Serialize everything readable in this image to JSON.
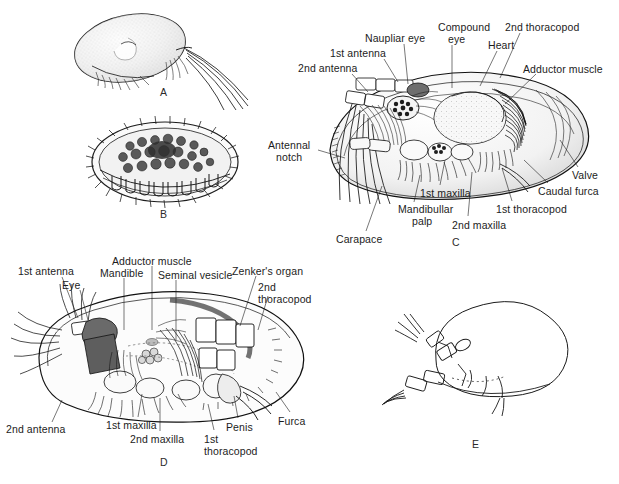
{
  "figure": {
    "type": "scientific-illustration",
    "background_color": "#ffffff",
    "ink_color": "#111111",
    "panel_count": 5
  },
  "panels": [
    {
      "id": "A",
      "letter": "A",
      "letter_pos": [
        160,
        86
      ],
      "caption": "",
      "description": "Whole animal, smooth stippled carapace in lateral view with long natatory antennal setae trailing to the right"
    },
    {
      "id": "B",
      "letter": "B",
      "letter_pos": [
        160,
        208
      ],
      "caption": "",
      "description": "Heavily ornamented tuberculate ostracod valve, external view"
    },
    {
      "id": "C",
      "letter": "C",
      "letter_pos": [
        452,
        236
      ],
      "caption": "",
      "description": "Lateral dissection showing appendages, eyes, heart and adductor muscle inside the carapace"
    },
    {
      "id": "D",
      "letter": "D",
      "letter_pos": [
        160,
        456
      ],
      "caption": "",
      "description": "Male lateral dissection showing reproductive organs, Zenker's organ, penis and furca"
    },
    {
      "id": "E",
      "letter": "E",
      "letter_pos": [
        472,
        438
      ],
      "caption": "",
      "description": "Simple outline drawing of an ostracod with antennae and thoracopods"
    }
  ],
  "labels_panel_c": [
    {
      "text": "2nd antenna",
      "x": 298,
      "y": 63,
      "align": "left",
      "leader": [
        [
          352,
          74
        ],
        [
          368,
          92
        ]
      ]
    },
    {
      "text": "1st antenna",
      "x": 330,
      "y": 48,
      "align": "left",
      "leader": [
        [
          384,
          59
        ],
        [
          398,
          82
        ]
      ]
    },
    {
      "text": "Naupliar eye",
      "x": 365,
      "y": 33,
      "align": "left",
      "leader": [
        [
          404,
          44
        ],
        [
          408,
          84
        ]
      ]
    },
    {
      "text": "Compound",
      "x": 438,
      "y": 22,
      "align": "left",
      "leader": [
        [
          452,
          45
        ],
        [
          452,
          88
        ]
      ]
    },
    {
      "text": "eye",
      "x": 448,
      "y": 34,
      "align": "left",
      "leader": null
    },
    {
      "text": "Heart",
      "x": 488,
      "y": 40,
      "align": "left",
      "leader": [
        [
          497,
          51
        ],
        [
          480,
          86
        ]
      ]
    },
    {
      "text": "2nd thoracopod",
      "x": 505,
      "y": 22,
      "align": "left",
      "leader": [
        [
          520,
          33
        ],
        [
          500,
          78
        ]
      ]
    },
    {
      "text": "Adductor muscle",
      "x": 523,
      "y": 64,
      "align": "left",
      "leader": [
        [
          536,
          74
        ],
        [
          505,
          104
        ]
      ]
    },
    {
      "text": "Antennal",
      "x": 268,
      "y": 140,
      "align": "left",
      "leader": [
        [
          318,
          150
        ],
        [
          345,
          158
        ]
      ]
    },
    {
      "text": "notch",
      "x": 276,
      "y": 152,
      "align": "left",
      "leader": null
    },
    {
      "text": "Carapace",
      "x": 336,
      "y": 234,
      "align": "left",
      "leader": [
        [
          366,
          231
        ],
        [
          382,
          186
        ]
      ]
    },
    {
      "text": "Mandibullar",
      "x": 398,
      "y": 204,
      "align": "left",
      "leader": [
        [
          414,
          202
        ],
        [
          420,
          175
        ]
      ]
    },
    {
      "text": "palp",
      "x": 412,
      "y": 216,
      "align": "left",
      "leader": null
    },
    {
      "text": "1st maxilla",
      "x": 420,
      "y": 188,
      "align": "left",
      "leader": [
        [
          440,
          185
        ],
        [
          445,
          160
        ]
      ]
    },
    {
      "text": "2nd maxilla",
      "x": 452,
      "y": 220,
      "align": "left",
      "leader": [
        [
          468,
          216
        ],
        [
          472,
          172
        ]
      ]
    },
    {
      "text": "1st thoracopod",
      "x": 496,
      "y": 204,
      "align": "left",
      "leader": [
        [
          512,
          201
        ],
        [
          502,
          168
        ]
      ]
    },
    {
      "text": "Caudal furca",
      "x": 538,
      "y": 186,
      "align": "left",
      "leader": [
        [
          548,
          183
        ],
        [
          524,
          160
        ]
      ]
    },
    {
      "text": "Valve",
      "x": 572,
      "y": 170,
      "align": "left",
      "leader": [
        [
          578,
          167
        ],
        [
          560,
          140
        ]
      ]
    }
  ],
  "labels_panel_d": [
    {
      "text": "1st antenna",
      "x": 18,
      "y": 266,
      "align": "left",
      "leader": [
        [
          62,
          277
        ],
        [
          78,
          318
        ]
      ]
    },
    {
      "text": "Eye",
      "x": 62,
      "y": 280,
      "align": "left",
      "leader": [
        [
          80,
          290
        ],
        [
          88,
          320
        ]
      ]
    },
    {
      "text": "Mandible",
      "x": 100,
      "y": 268,
      "align": "left",
      "leader": [
        [
          124,
          278
        ],
        [
          124,
          330
        ]
      ]
    },
    {
      "text": "Adductor muscle",
      "x": 112,
      "y": 256,
      "align": "left",
      "leader": [
        [
          152,
          266
        ],
        [
          152,
          330
        ]
      ]
    },
    {
      "text": "Seminal vesicle",
      "x": 158,
      "y": 270,
      "align": "left",
      "leader": [
        [
          176,
          280
        ],
        [
          176,
          340
        ]
      ]
    },
    {
      "text": "Zenker's organ",
      "x": 232,
      "y": 266,
      "align": "left",
      "leader": [
        [
          256,
          276
        ],
        [
          240,
          326
        ]
      ]
    },
    {
      "text": "2nd",
      "x": 258,
      "y": 282,
      "align": "left",
      "leader": [
        [
          268,
          296
        ],
        [
          258,
          330
        ]
      ]
    },
    {
      "text": "thoracopod",
      "x": 258,
      "y": 294,
      "align": "left",
      "leader": null
    },
    {
      "text": "2nd antenna",
      "x": 6,
      "y": 424,
      "align": "left",
      "leader": [
        [
          52,
          422
        ],
        [
          62,
          400
        ]
      ]
    },
    {
      "text": "1st maxilla",
      "x": 106,
      "y": 420,
      "align": "left",
      "leader": [
        [
          138,
          417
        ],
        [
          142,
          394
        ]
      ]
    },
    {
      "text": "2nd maxilla",
      "x": 130,
      "y": 434,
      "align": "left",
      "leader": [
        [
          160,
          431
        ],
        [
          160,
          398
        ]
      ]
    },
    {
      "text": "1st",
      "x": 204,
      "y": 434,
      "align": "left",
      "leader": [
        [
          214,
          430
        ],
        [
          208,
          404
        ]
      ]
    },
    {
      "text": "thoracopod",
      "x": 204,
      "y": 446,
      "align": "left",
      "leader": null
    },
    {
      "text": "Penis",
      "x": 226,
      "y": 422,
      "align": "left",
      "leader": [
        [
          238,
          418
        ],
        [
          234,
          396
        ]
      ]
    },
    {
      "text": "Furca",
      "x": 278,
      "y": 416,
      "align": "left",
      "leader": [
        [
          290,
          412
        ],
        [
          276,
          392
        ]
      ]
    }
  ]
}
